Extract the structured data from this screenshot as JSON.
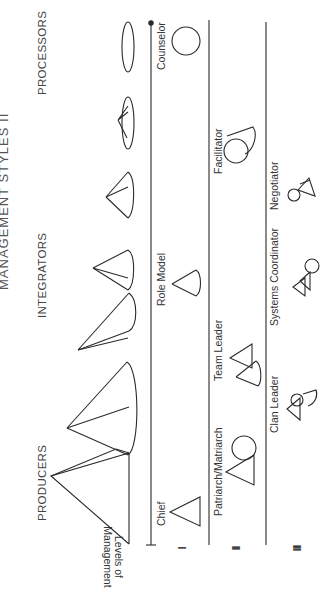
{
  "diagram": {
    "title": "MANAGEMENT STYLES II",
    "orientation": "rotated 90 degrees counter-clockwise",
    "categories": [
      {
        "id": "producers",
        "label": "PRODUCERS"
      },
      {
        "id": "integrators",
        "label": "INTEGRATORS"
      },
      {
        "id": "processors",
        "label": "PROCESSORS"
      }
    ],
    "axis_label": {
      "line1": "Levels of",
      "line2": "Management"
    },
    "levels": [
      {
        "numeral": "I",
        "roles": [
          "Chief",
          "Role Model",
          "Counselor"
        ]
      },
      {
        "numeral": "II",
        "roles": [
          "Patriarch/Matriarch",
          "Team Leader",
          "Facilitator"
        ]
      },
      {
        "numeral": "III",
        "roles": [
          "Clan Leader",
          "Systems Coordinator",
          "Negotiator"
        ]
      }
    ],
    "cone_progression": [
      "solid pyramid",
      "cone",
      "cone",
      "cone",
      "cone",
      "flattened cone",
      "ellipse"
    ],
    "icons": {
      "Chief": "triangle",
      "Role Model": "cone",
      "Counselor": "circle",
      "Patriarch/Matriarch": "triangle-with-circle",
      "Team Leader": "triangle-with-cone",
      "Facilitator": "circle-with-cone",
      "Clan Leader": "triangle-circle-cone",
      "Systems Coordinator": "triangle-triangle-circle",
      "Negotiator": "circle-triangle-triangle"
    }
  }
}
